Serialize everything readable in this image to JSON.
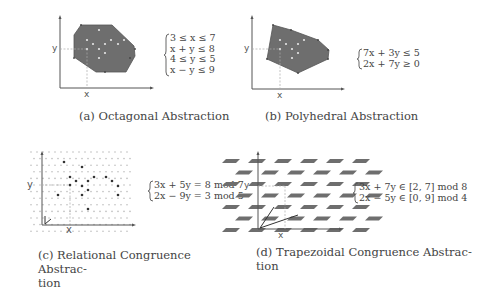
{
  "figure": {
    "panels": [
      {
        "id": "a",
        "caption": "(a) Octagonal Abstraction",
        "caption_lines": [
          "(a) Octagonal Abstraction"
        ],
        "axis_x_label": "x",
        "axis_y_label": "y",
        "constraints": [
          "3 ≤ x ≤ 7",
          "x + y ≤ 8",
          "4 ≤ y ≤ 5",
          "x − y ≤ 9"
        ]
      },
      {
        "id": "b",
        "caption": "(b) Polyhedral Abstraction",
        "caption_lines": [
          "(b) Polyhedral Abstraction"
        ],
        "axis_x_label": "x",
        "axis_y_label": "y",
        "constraints": [
          "7x + 3y ≤ 5",
          "2x + 7y ≥ 0"
        ]
      },
      {
        "id": "c",
        "caption": "(c) Relational Congruence Abstraction",
        "caption_lines": [
          "(c) Relational Congruence Abstrac-",
          "tion"
        ],
        "axis_x_label": "x",
        "axis_y_label": "y",
        "constraints": [
          "3x + 5y = 8 mod 7",
          "2x − 9y = 3 mod 5"
        ]
      },
      {
        "id": "d",
        "caption": "(d) Trapezoidal Congruence Abstraction",
        "caption_lines": [
          "(d) Trapezoidal Congruence Abstrac-",
          "tion"
        ],
        "axis_x_label": "x",
        "axis_y_label": "y",
        "constraints": [
          "3x + 7y ∈ [2, 7] mod 8",
          "2x − 5y ∈ [0, 9] mod 4"
        ]
      }
    ]
  },
  "colors": {
    "region_fill": "#6e6e6e",
    "axis": "#555555",
    "grid_dot": "#bdbdbd",
    "point_dark": "#333333",
    "point_light": "#e6e6e6",
    "text": "#444444"
  }
}
